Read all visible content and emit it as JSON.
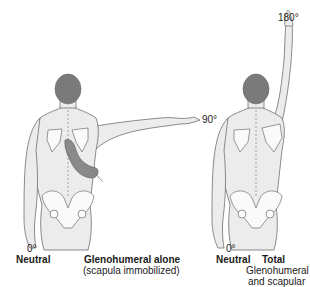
{
  "figure": {
    "left_panel": {
      "start_angle": "0°",
      "start_label": "Neutral",
      "end_angle": "90°",
      "title": "Glenohumeral alone",
      "subtitle": "(scapula immobilized)"
    },
    "right_panel": {
      "start_angle": "0°",
      "start_label": "Neutral",
      "end_angle": "180°",
      "title": "Total",
      "subtitle_line1": "Glenohumeral",
      "subtitle_line2": "and scapular"
    },
    "colors": {
      "skin": "#ececec",
      "outline": "#6e6e6e",
      "hair": "#7a7a7a",
      "examiner_hand": "#8a8a8a",
      "spine_dash": "#9a9a9a"
    }
  }
}
